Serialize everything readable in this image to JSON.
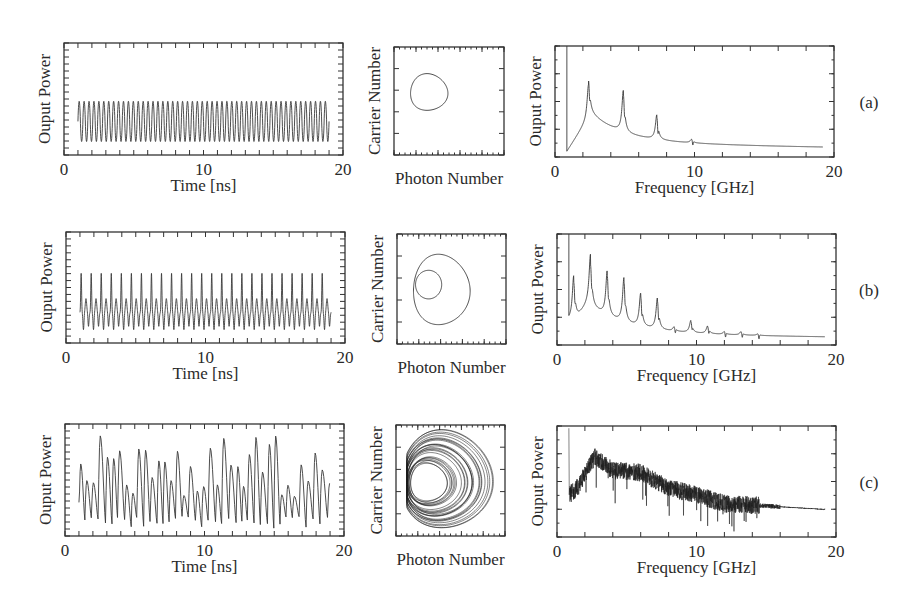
{
  "figure": {
    "rows": [
      {
        "label": "(a)"
      },
      {
        "label": "(b)"
      },
      {
        "label": "(c)"
      }
    ],
    "time_panel": {
      "xlabel": "Time [ns]",
      "ylabel": "Ouput Power",
      "xticks": [
        "0",
        "10",
        "20"
      ]
    },
    "phase_panel": {
      "xlabel": "Photon Number",
      "ylabel": "Carrier Number"
    },
    "spectrum_panel": {
      "xlabel": "Frequency [GHz]",
      "ylabel": "Ouput Power",
      "xticks": [
        "0",
        "10",
        "20"
      ]
    }
  },
  "chart_data": [
    {
      "id": "a-time",
      "type": "line",
      "row": "(a)",
      "title": "",
      "xlabel": "Time [ns]",
      "ylabel": "Ouput Power",
      "xlim": [
        0,
        20
      ],
      "xticks": [
        0,
        10,
        20
      ],
      "grid": false,
      "description": "Periodic oscillation, period-1, ~50 cycles from t≈1 to 19 ns, constant amplitude",
      "x_range": [
        1,
        19
      ],
      "cycles": 51,
      "y_range_norm": [
        0.12,
        0.48
      ]
    },
    {
      "id": "a-phase",
      "type": "line",
      "row": "(a)",
      "xlabel": "Photon Number",
      "ylabel": "Carrier Number",
      "description": "Single closed limit cycle (period-1 orbit)",
      "loops": 1
    },
    {
      "id": "a-spectrum",
      "type": "line",
      "row": "(a)",
      "xlabel": "Frequency [GHz]",
      "ylabel": "Ouput Power",
      "xlim": [
        0,
        20
      ],
      "xticks": [
        0,
        10,
        20
      ],
      "grid": false,
      "peaks": [
        {
          "f": 2.4,
          "height_norm": 0.72
        },
        {
          "f": 4.9,
          "height_norm": 0.6
        },
        {
          "f": 7.3,
          "height_norm": 0.38
        },
        {
          "f": 9.8,
          "height_norm": 0.16
        }
      ],
      "baseline_norm_at_20": 0.06
    },
    {
      "id": "b-time",
      "type": "line",
      "row": "(b)",
      "title": "",
      "xlabel": "Time [ns]",
      "ylabel": "Ouput Power",
      "xlim": [
        0,
        20
      ],
      "xticks": [
        0,
        10,
        20
      ],
      "grid": false,
      "description": "Period-2 oscillation: alternating tall and short peaks, ~25 tall peaks from t≈1 to 19 ns",
      "x_range": [
        1,
        19
      ],
      "tall_peaks": 25,
      "tall_height_norm": 0.63,
      "short_height_norm": 0.4,
      "trough_norm": 0.12
    },
    {
      "id": "b-phase",
      "type": "line",
      "row": "(b)",
      "xlabel": "Photon Number",
      "ylabel": "Carrier Number",
      "description": "Double-loop closed orbit (period-2)",
      "loops": 2
    },
    {
      "id": "b-spectrum",
      "type": "line",
      "row": "(b)",
      "xlabel": "Frequency [GHz]",
      "ylabel": "Ouput Power",
      "xlim": [
        0,
        20
      ],
      "xticks": [
        0,
        10,
        20
      ],
      "grid": false,
      "peaks": [
        {
          "f": 1.2,
          "height_norm": 0.6
        },
        {
          "f": 2.4,
          "height_norm": 0.76
        },
        {
          "f": 3.6,
          "height_norm": 0.66
        },
        {
          "f": 4.8,
          "height_norm": 0.6
        },
        {
          "f": 6.0,
          "height_norm": 0.46
        },
        {
          "f": 7.2,
          "height_norm": 0.42
        },
        {
          "f": 8.4,
          "height_norm": 0.16
        },
        {
          "f": 9.6,
          "height_norm": 0.22
        },
        {
          "f": 10.8,
          "height_norm": 0.17
        },
        {
          "f": 12.0,
          "height_norm": 0.12
        },
        {
          "f": 13.2,
          "height_norm": 0.12
        },
        {
          "f": 14.4,
          "height_norm": 0.1
        }
      ],
      "baseline_norm_at_20": 0.05
    },
    {
      "id": "c-time",
      "type": "line",
      "row": "(c)",
      "title": "",
      "xlabel": "Time [ns]",
      "ylabel": "Ouput Power",
      "xlim": [
        0,
        20
      ],
      "xticks": [
        0,
        10,
        20
      ],
      "grid": false,
      "description": "Chaotic oscillation with irregular peak heights between ~0.5 and 0.92 (normalized), t≈1 to 19 ns",
      "x_range": [
        1,
        19
      ]
    },
    {
      "id": "c-phase",
      "type": "scatter",
      "row": "(c)",
      "xlabel": "Photon Number",
      "ylabel": "Carrier Number",
      "description": "Dense chaotic attractor filling a heart/shell-shaped region"
    },
    {
      "id": "c-spectrum",
      "type": "line",
      "row": "(c)",
      "xlabel": "Frequency [GHz]",
      "ylabel": "Ouput Power",
      "xlim": [
        0,
        20
      ],
      "xticks": [
        0,
        10,
        20
      ],
      "grid": false,
      "description": "Broadband noisy spectrum peaking near 2.5–3 GHz, decaying to flat tail beyond ~15 GHz",
      "envelope": [
        {
          "f": 0.9,
          "v": 0.38
        },
        {
          "f": 1.5,
          "v": 0.45
        },
        {
          "f": 2.7,
          "v": 0.72
        },
        {
          "f": 4.0,
          "v": 0.6
        },
        {
          "f": 6.0,
          "v": 0.58
        },
        {
          "f": 8.0,
          "v": 0.44
        },
        {
          "f": 10.0,
          "v": 0.38
        },
        {
          "f": 12.0,
          "v": 0.3
        },
        {
          "f": 15.0,
          "v": 0.28
        },
        {
          "f": 19.0,
          "v": 0.25
        }
      ]
    }
  ]
}
